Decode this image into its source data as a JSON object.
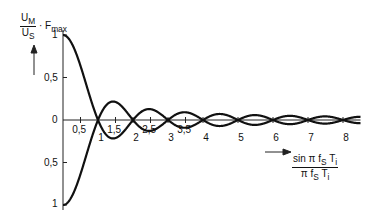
{
  "chart_data": {
    "type": "line",
    "title": "",
    "ylabel": {
      "num": "U_M",
      "den": "U_S",
      "suffix": "· F_max"
    },
    "xlabel": {
      "num": "sin π f_S T_i",
      "den": "π f_S T_i"
    },
    "x_ticks": [
      "0,5",
      "1",
      "1,5",
      "2",
      "2,5",
      "3",
      "3,5",
      "4",
      "5",
      "6",
      "7",
      "8"
    ],
    "y_ticks_upper": [
      "1",
      "0,5",
      "0"
    ],
    "y_ticks_lower": [
      "0,5",
      "1"
    ],
    "xlim": [
      0,
      8.5
    ],
    "ylim": [
      -1,
      1
    ],
    "series": [
      {
        "name": "upper envelope |sinc(x)|",
        "x": [
          0,
          0.5,
          1,
          1.5,
          2,
          2.5,
          3,
          3.5,
          4,
          4.5,
          5,
          5.5,
          6,
          6.5,
          7,
          7.5,
          8
        ],
        "values": [
          1,
          0.64,
          0,
          0.21,
          0,
          0.13,
          0,
          0.09,
          0,
          0.07,
          0,
          0.06,
          0,
          0.05,
          0,
          0.04,
          0
        ]
      },
      {
        "name": "lower envelope -|sinc(x)|",
        "x": [
          0,
          0.5,
          1,
          1.5,
          2,
          2.5,
          3,
          3.5,
          4,
          4.5,
          5,
          5.5,
          6,
          6.5,
          7,
          7.5,
          8
        ],
        "values": [
          -1,
          -0.64,
          0,
          -0.21,
          0,
          -0.13,
          0,
          -0.09,
          0,
          -0.07,
          0,
          -0.06,
          0,
          -0.05,
          0,
          -0.04,
          0
        ]
      }
    ],
    "grid": false,
    "legend": "none"
  },
  "labels": {
    "y_num": "U",
    "y_num_sub": "M",
    "y_den": "U",
    "y_den_sub": "S",
    "y_suffix": "· F",
    "y_suffix_sub": "max",
    "x_num": "sin π f",
    "x_num_sub": "S",
    "x_num_tail": " T",
    "x_num_tail_sub": "i",
    "x_den": "π f",
    "x_den_sub": "S",
    "x_den_tail": " T",
    "x_den_tail_sub": "i"
  }
}
